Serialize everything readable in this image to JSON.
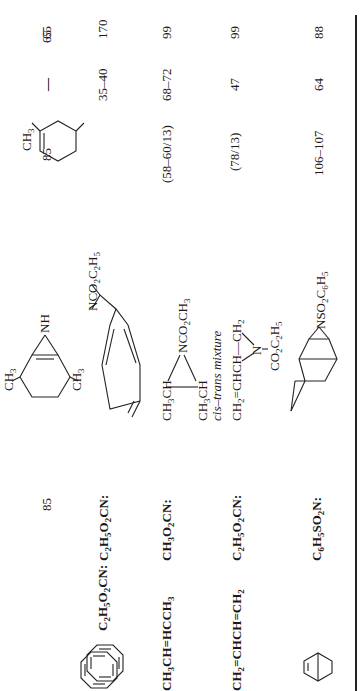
{
  "table": {
    "rows": [
      {
        "reactant": {
          "type": "structure",
          "name": "cyclooctatetraene",
          "icon": "cyclooctatetraene-ring"
        },
        "reagent_formula": "C2H5O2CN:",
        "product": {
          "type": "structure",
          "name": "bicyclic aziridine with NCO2C2H5 and nine-membered triene ring",
          "label": "NCO2C2H5"
        },
        "col_a": "",
        "col_b": "",
        "col_c": "170"
      },
      {
        "reactant": {
          "type": "none"
        },
        "reagent_formula": "",
        "product": {
          "type": "structure",
          "name": "2,5-dimethyl benzazirine",
          "labels": [
            "CH3",
            "NH",
            "CH3"
          ]
        },
        "col_a": "85",
        "col_b": "—",
        "col_c": "65"
      },
      {
        "reactant": {
          "type": "text",
          "text": "CH3CH=HCCH3"
        },
        "reagent_formula": "CH3O2CN:",
        "product": {
          "type": "structure",
          "labels": [
            "CH3CH",
            "NCO2CH3",
            "CH3CH"
          ],
          "note": "cis–trans mixture"
        },
        "col_a": "(58–60/13)",
        "col_b": "68–72",
        "col_c": "99"
      },
      {
        "reactant": {
          "type": "text",
          "text": "CH2=CHCH=CH2"
        },
        "reagent_formula": "C2H5O2CN:",
        "product": {
          "type": "structure",
          "labels": [
            "CH2=CHCH—CH2",
            "N",
            "CO2C2H5"
          ]
        },
        "col_a": "(78/13)",
        "col_b": "47",
        "col_c": "99"
      },
      {
        "reactant": {
          "type": "structure",
          "name": "norbornene",
          "icon": "norbornene"
        },
        "reagent_formula": "C6H5SO2N:",
        "product": {
          "type": "structure",
          "name": "norbornane aziridine",
          "label": "NSO2C6H5"
        },
        "col_a": "106–107",
        "col_b": "64",
        "col_c": "88"
      }
    ],
    "col_b_row2_extra": "35–40"
  }
}
